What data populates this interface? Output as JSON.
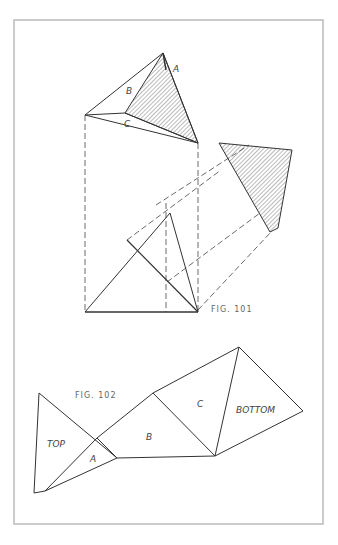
{
  "figure_101": {
    "caption": "FIG. 101",
    "top_view_labels": {
      "a": "A",
      "b": "B",
      "c": "C"
    }
  },
  "figure_102": {
    "caption": "FIG. 102",
    "face_labels": {
      "top": "TOP",
      "a": "A",
      "b": "B",
      "c": "C",
      "bottom": "BOTTOM"
    }
  },
  "colors": {
    "line": "#333333",
    "frame": "#bbbbbb",
    "hatch": "#555555"
  }
}
